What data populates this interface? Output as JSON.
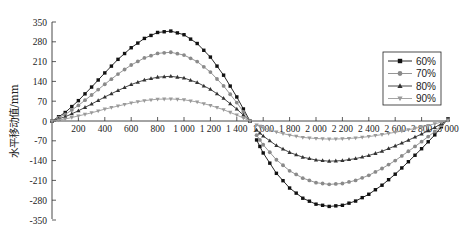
{
  "chart_data": {
    "type": "line",
    "title": "",
    "xlabel": "",
    "ylabel": "水平移动值/mm",
    "xlim": [
      0,
      3000
    ],
    "ylim": [
      -350,
      350
    ],
    "x_ticks": [
      200,
      400,
      600,
      800,
      1000,
      1200,
      1400,
      1600,
      1800,
      2000,
      2200,
      2400,
      2600,
      2800,
      3000
    ],
    "x_tick_labels": [
      "200",
      "400",
      "600",
      "800",
      "1 000",
      "1 200",
      "1 400",
      "1 600",
      "1 800",
      "2 000",
      "2 200",
      "2 400",
      "2 600",
      "2 800",
      "3 000"
    ],
    "y_ticks": [
      350,
      280,
      210,
      140,
      70,
      0,
      -70,
      -140,
      -210,
      -280,
      -350
    ],
    "y_tick_labels": [
      "350",
      "280",
      "210",
      "140",
      "70",
      "0",
      "-70",
      "-140",
      "-210",
      "-280",
      "-350"
    ],
    "grid": false,
    "legend_position": "right",
    "x_positive": [
      0,
      100,
      200,
      300,
      400,
      500,
      600,
      700,
      800,
      900,
      1000,
      1100,
      1200,
      1300,
      1400,
      1500
    ],
    "x_negative": [
      1550,
      1600,
      1700,
      1800,
      1900,
      2000,
      2100,
      2200,
      2300,
      2400,
      2500,
      2600,
      2700,
      2800,
      2900,
      3000
    ],
    "series": [
      {
        "name": "60%",
        "color": "#111111",
        "marker": "square",
        "positive": [
          0,
          30,
          72,
          120,
          170,
          218,
          259,
          292,
          313,
          318,
          305,
          274,
          226,
          162,
          85,
          0
        ],
        "negative": [
          -67,
          -113,
          -185,
          -237,
          -273,
          -294,
          -302,
          -298,
          -283,
          -259,
          -227,
          -188,
          -144,
          -98,
          -49,
          8
        ]
      },
      {
        "name": "70%",
        "color": "#8a8a8a",
        "marker": "circle",
        "positive": [
          0,
          23,
          55,
          92,
          130,
          166,
          198,
          223,
          239,
          243,
          233,
          210,
          173,
          124,
          65,
          0
        ],
        "negative": [
          -50,
          -84,
          -137,
          -176,
          -202,
          -218,
          -224,
          -221,
          -210,
          -192,
          -168,
          -140,
          -107,
          -73,
          -37,
          6
        ]
      },
      {
        "name": "80%",
        "color": "#333333",
        "marker": "triangle-up",
        "positive": [
          0,
          15,
          36,
          60,
          85,
          108,
          129,
          145,
          155,
          158,
          152,
          136,
          112,
          80,
          42,
          0
        ],
        "negative": [
          -32,
          -53,
          -87,
          -111,
          -128,
          -138,
          -142,
          -140,
          -133,
          -122,
          -107,
          -88,
          -68,
          -46,
          -23,
          4
        ]
      },
      {
        "name": "90%",
        "color": "#9a9a9a",
        "marker": "triangle-down",
        "positive": [
          0,
          7,
          18,
          29,
          42,
          53,
          64,
          72,
          77,
          78,
          75,
          67,
          55,
          40,
          21,
          0
        ],
        "negative": [
          -14,
          -24,
          -39,
          -50,
          -58,
          -62,
          -64,
          -63,
          -60,
          -55,
          -48,
          -40,
          -31,
          -21,
          -10,
          2
        ]
      }
    ]
  }
}
